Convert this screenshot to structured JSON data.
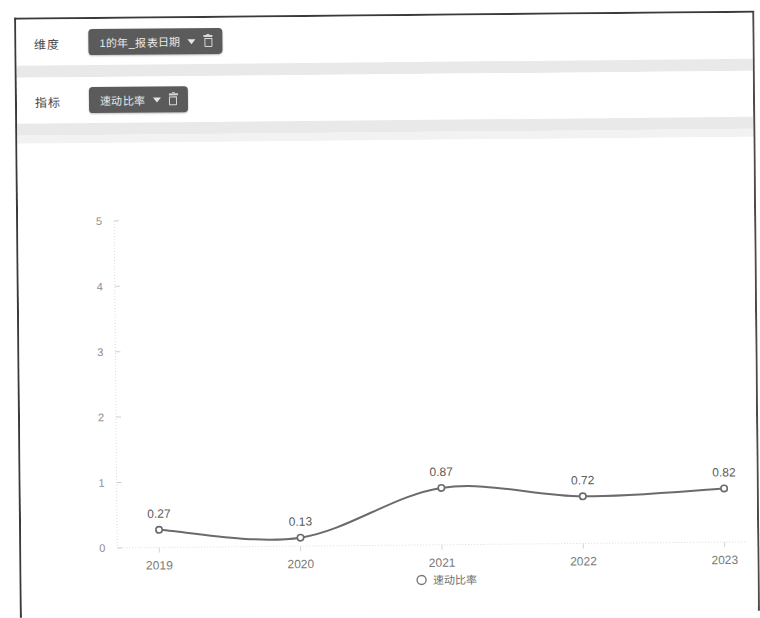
{
  "filters": [
    {
      "label": "维度",
      "chip": {
        "text": "1的年_报表日期",
        "caret": "chevron-down-icon",
        "delete": "trash-icon"
      }
    },
    {
      "label": "指标",
      "chip": {
        "text": "速动比率",
        "caret": "chevron-down-icon",
        "delete": "trash-icon"
      }
    }
  ],
  "chart_data": {
    "type": "line",
    "title": "",
    "xlabel": "",
    "ylabel": "",
    "categories": [
      "2019",
      "2020",
      "2021",
      "2022",
      "2023"
    ],
    "series": [
      {
        "name": "速动比率",
        "values": [
          0.27,
          0.13,
          0.87,
          0.72,
          0.82
        ],
        "labels": [
          "0.27",
          "0.13",
          "0.87",
          "0.72",
          "0.82"
        ],
        "color": "#6b6b6b",
        "marker": "open-circle"
      }
    ],
    "ylim": [
      0,
      5
    ],
    "yticks": [
      "0",
      "1",
      "2",
      "3",
      "4",
      "5"
    ],
    "grid": false,
    "legend": {
      "position": "bottom",
      "entries": [
        "速动比率"
      ],
      "marker": "open-circle"
    }
  }
}
